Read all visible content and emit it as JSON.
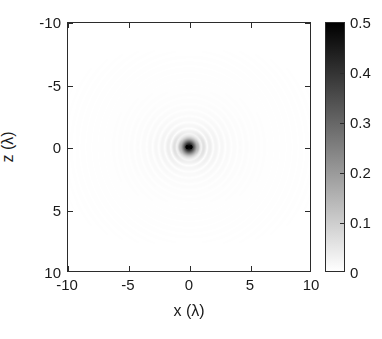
{
  "chart_data": {
    "type": "heatmap",
    "title": "",
    "xlabel": "x (λ)",
    "ylabel": "z (λ)",
    "xlim": [
      -10,
      10
    ],
    "ylim": [
      -10,
      10
    ],
    "y_axis_direction": "reverse",
    "xticks": [
      -10,
      -5,
      0,
      5,
      10
    ],
    "xticklabels": [
      "-10",
      "-5",
      "0",
      "5",
      "10"
    ],
    "yticks": [
      -10,
      -5,
      0,
      5,
      10
    ],
    "yticklabels": [
      "-10",
      "-5",
      "0",
      "5",
      "10"
    ],
    "grid": false,
    "colormap": "gray_reversed",
    "colorbar": {
      "position": "right",
      "vmin": 0,
      "vmax": 0.5,
      "ticks": [
        0,
        0.1,
        0.2,
        0.3,
        0.4,
        0.5
      ],
      "ticklabels": [
        "0",
        "0.1",
        "0.2",
        "0.3",
        "0.4",
        "0.5"
      ],
      "low_color": "#ffffff",
      "high_color": "#000000"
    },
    "field_model": {
      "description": "Focused scalar wave intensity field; concentric diffraction rings about a dark focal core at the origin, with low-amplitude lobes along the vertical (z) axis.",
      "center": [
        0,
        0
      ],
      "peak_value": 0.5,
      "ring_wavelength": 1.0,
      "radial_decay": 0.42,
      "axial_suppression": 0.55,
      "background_value": 0.0
    },
    "annotations": []
  },
  "axes": {
    "x_title": "x (λ)",
    "y_title": "z (λ)"
  },
  "colorbar_labels": [
    "0.5",
    "0.4",
    "0.3",
    "0.2",
    "0.1",
    "0"
  ]
}
